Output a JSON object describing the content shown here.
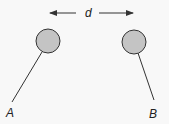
{
  "diagram": {
    "type": "physics-electrostatics",
    "distance_label": "d",
    "spheres": [
      {
        "label": "A",
        "cx": 48,
        "cy": 41,
        "r": 12,
        "rod": {
          "x1": 42,
          "y1": 52,
          "x2": 12,
          "y2": 102
        },
        "label_x": 6,
        "label_y": 117
      },
      {
        "label": "B",
        "cx": 134,
        "cy": 42,
        "r": 12,
        "rod": {
          "x1": 138,
          "y1": 53,
          "x2": 154,
          "y2": 100
        },
        "label_x": 149,
        "label_y": 118
      }
    ],
    "arrow": {
      "left_x1": 49,
      "left_x2": 76,
      "right_x1": 99,
      "right_x2": 133,
      "y": 13,
      "label_x": 88,
      "label_y": 17
    },
    "colors": {
      "sphere_fill": "#c4c4c4",
      "stroke": "#333333",
      "background": "#f8f8f8"
    }
  }
}
